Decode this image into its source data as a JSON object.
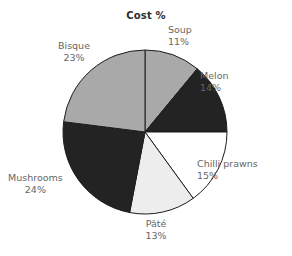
{
  "chart_data": {
    "type": "pie",
    "title": "Cost %",
    "xlabel": "",
    "ylabel": "",
    "legend_position": "none",
    "grid": false,
    "start_angle_deg": 0,
    "direction": "clockwise",
    "categories": [
      "Soup",
      "Melon",
      "Chilli prawns",
      "Pâté",
      "Mushrooms",
      "Bisque"
    ],
    "values": [
      11,
      14,
      15,
      13,
      24,
      23
    ],
    "value_suffix": "%",
    "slices": [
      {
        "label": "Soup",
        "value": 11,
        "value_text": "11%",
        "color": "#a9a9a9",
        "stroke": "#1c1c1c"
      },
      {
        "label": "Melon",
        "value": 14,
        "value_text": "14%",
        "color": "#232323",
        "stroke": "#1c1c1c"
      },
      {
        "label": "Chilli prawns",
        "value": 15,
        "value_text": "15%",
        "color": "#ffffff",
        "stroke": "#1c1c1c"
      },
      {
        "label": "Pâté",
        "value": 13,
        "value_text": "13%",
        "color": "#ededed",
        "stroke": "#1c1c1c"
      },
      {
        "label": "Mushrooms",
        "value": 24,
        "value_text": "24%",
        "color": "#232323",
        "stroke": "#1c1c1c"
      },
      {
        "label": "Bisque",
        "value": 23,
        "value_text": "23%",
        "color": "#a9a9a9",
        "stroke": "#1c1c1c"
      }
    ]
  },
  "colors": {
    "background": "#ffffff",
    "title_text": "#2e2e2e",
    "label_text": "#666666",
    "outline": "#1c1c1c",
    "gray_fill": "#a9a9a9",
    "dark_fill": "#232323",
    "white_fill": "#ffffff",
    "light_fill": "#ededed"
  },
  "geometry": {
    "center_x": 145,
    "center_y": 132,
    "radius": 82
  }
}
